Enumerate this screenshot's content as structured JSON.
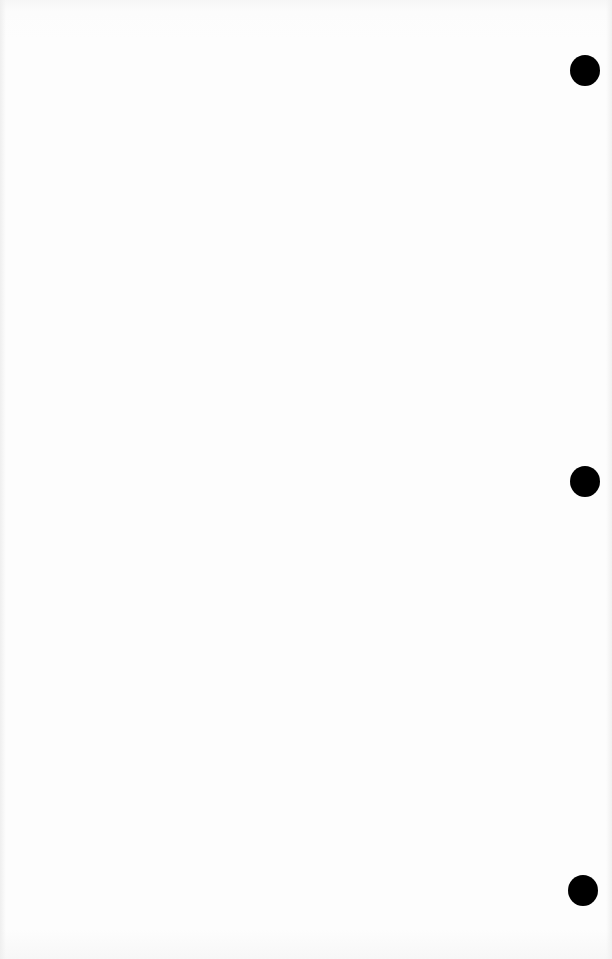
{
  "page": {
    "type": "blank scanned page",
    "background_color": "#fdfdfd",
    "punch_holes": [
      {
        "cx": 585,
        "cy": 70,
        "diameter": 30,
        "color": "#000000"
      },
      {
        "cx": 585,
        "cy": 481,
        "diameter": 30,
        "color": "#000000"
      },
      {
        "cx": 583,
        "cy": 890,
        "diameter": 30,
        "color": "#000000"
      }
    ]
  }
}
